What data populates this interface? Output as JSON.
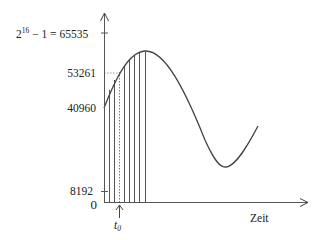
{
  "diagram": {
    "type": "sampled-analog-signal",
    "y_axis": {
      "labels": [
        {
          "id": "max",
          "base": "2",
          "exp": "16",
          "rest": " − 1 = 65535",
          "value": 65535
        },
        {
          "id": "v53261",
          "text": "53261",
          "value": 53261
        },
        {
          "id": "v40960",
          "text": "40960",
          "value": 40960
        },
        {
          "id": "v8192",
          "text": "8192",
          "value": 8192
        },
        {
          "id": "zero",
          "text": "0",
          "value": 0
        }
      ]
    },
    "x_axis": {
      "label": "Zeit",
      "marker": {
        "base": "t",
        "sub": "0"
      }
    },
    "sample_lines": 8,
    "highlighted_sample": {
      "index": 3,
      "value": 53261,
      "style": "dotted"
    },
    "colors": {
      "line": "#444444",
      "axis": "#555555",
      "text": "#222222"
    }
  }
}
